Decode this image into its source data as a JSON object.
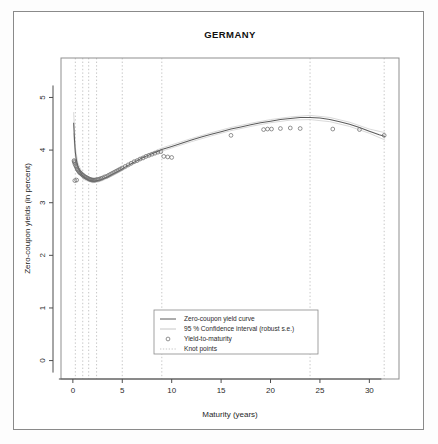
{
  "chart_data": {
    "type": "line",
    "title": "GERMANY",
    "xlabel": "Maturity (years)",
    "ylabel": "Zero-coupon yields (in percent)",
    "xlim": [
      -1.2,
      33.0
    ],
    "ylim": [
      -0.35,
      5.75
    ],
    "xticks": [
      0,
      5,
      10,
      15,
      20,
      25,
      30
    ],
    "yticks": [
      0,
      1,
      2,
      3,
      4,
      5
    ],
    "grid": false,
    "legend_position": "bottom-center",
    "series": [
      {
        "name": "Zero-coupon yield curve",
        "type": "line",
        "x": [
          0.08,
          0.17,
          0.25,
          0.35,
          0.5,
          0.7,
          0.9,
          1.1,
          1.3,
          1.5,
          1.75,
          2.0,
          2.25,
          2.5,
          2.75,
          3.0,
          3.5,
          4.0,
          4.5,
          5.0,
          5.5,
          6.0,
          6.5,
          7.0,
          7.5,
          8.0,
          8.5,
          9.0,
          9.5,
          10.0,
          11.0,
          12.0,
          13.0,
          14.0,
          15.0,
          16.0,
          17.0,
          18.0,
          19.0,
          20.0,
          21.0,
          22.0,
          23.0,
          24.0,
          25.0,
          26.0,
          27.0,
          28.0,
          29.0,
          30.0,
          31.0,
          31.6
        ],
        "y": [
          4.52,
          4.18,
          3.96,
          3.82,
          3.7,
          3.6,
          3.53,
          3.49,
          3.46,
          3.44,
          3.42,
          3.41,
          3.41,
          3.42,
          3.43,
          3.45,
          3.49,
          3.54,
          3.59,
          3.64,
          3.7,
          3.75,
          3.8,
          3.85,
          3.89,
          3.93,
          3.97,
          4.01,
          4.04,
          4.07,
          4.13,
          4.19,
          4.25,
          4.3,
          4.35,
          4.4,
          4.44,
          4.48,
          4.52,
          4.55,
          4.58,
          4.6,
          4.62,
          4.62,
          4.61,
          4.58,
          4.54,
          4.49,
          4.43,
          4.36,
          4.29,
          4.26
        ]
      },
      {
        "name": "95 % Confidence interval (robust s.e.)",
        "type": "band-upper",
        "x": [
          0.08,
          0.25,
          0.5,
          1.0,
          1.5,
          2.0,
          2.5,
          3.0,
          4.0,
          5.0,
          6.0,
          7.0,
          8.0,
          9.0,
          10.0,
          12.0,
          14.0,
          16.0,
          18.0,
          20.0,
          22.0,
          24.0,
          26.0,
          28.0,
          30.0,
          31.6
        ],
        "y": [
          4.72,
          4.05,
          3.76,
          3.54,
          3.47,
          3.44,
          3.45,
          3.48,
          3.57,
          3.67,
          3.78,
          3.88,
          3.96,
          4.04,
          4.1,
          4.22,
          4.33,
          4.43,
          4.51,
          4.58,
          4.63,
          4.66,
          4.62,
          4.53,
          4.4,
          4.33
        ]
      },
      {
        "name": "95 % Confidence interval (robust s.e.) lower",
        "type": "band-lower",
        "x": [
          0.08,
          0.25,
          0.5,
          1.0,
          1.5,
          2.0,
          2.5,
          3.0,
          4.0,
          5.0,
          6.0,
          7.0,
          8.0,
          9.0,
          10.0,
          12.0,
          14.0,
          16.0,
          18.0,
          20.0,
          22.0,
          24.0,
          26.0,
          28.0,
          30.0,
          31.6
        ],
        "y": [
          4.32,
          3.88,
          3.64,
          3.45,
          3.41,
          3.38,
          3.39,
          3.42,
          3.51,
          3.61,
          3.72,
          3.82,
          3.9,
          3.98,
          4.04,
          4.16,
          4.27,
          4.37,
          4.45,
          4.52,
          4.57,
          4.58,
          4.54,
          4.45,
          4.32,
          4.19
        ]
      }
    ],
    "scatter": {
      "name": "Yield-to-maturity",
      "marker": "open-circle",
      "points": [
        [
          0.12,
          3.8
        ],
        [
          0.14,
          3.78
        ],
        [
          0.18,
          3.76
        ],
        [
          0.22,
          3.73
        ],
        [
          0.2,
          3.42
        ],
        [
          0.38,
          3.43
        ],
        [
          0.3,
          3.7
        ],
        [
          0.36,
          3.68
        ],
        [
          0.42,
          3.65
        ],
        [
          0.48,
          3.63
        ],
        [
          0.55,
          3.61
        ],
        [
          0.62,
          3.59
        ],
        [
          0.7,
          3.57
        ],
        [
          0.78,
          3.56
        ],
        [
          0.86,
          3.55
        ],
        [
          0.95,
          3.53
        ],
        [
          1.05,
          3.52
        ],
        [
          1.15,
          3.5
        ],
        [
          1.25,
          3.49
        ],
        [
          1.35,
          3.48
        ],
        [
          1.45,
          3.47
        ],
        [
          1.55,
          3.46
        ],
        [
          1.65,
          3.45
        ],
        [
          1.75,
          3.44
        ],
        [
          1.85,
          3.44
        ],
        [
          1.95,
          3.43
        ],
        [
          2.05,
          3.43
        ],
        [
          2.15,
          3.43
        ],
        [
          2.25,
          3.43
        ],
        [
          2.4,
          3.44
        ],
        [
          2.55,
          3.44
        ],
        [
          2.7,
          3.45
        ],
        [
          2.85,
          3.46
        ],
        [
          3.0,
          3.47
        ],
        [
          3.2,
          3.49
        ],
        [
          3.4,
          3.5
        ],
        [
          3.6,
          3.52
        ],
        [
          3.8,
          3.54
        ],
        [
          4.0,
          3.56
        ],
        [
          4.2,
          3.58
        ],
        [
          4.4,
          3.6
        ],
        [
          4.6,
          3.62
        ],
        [
          4.8,
          3.64
        ],
        [
          5.0,
          3.66
        ],
        [
          5.3,
          3.69
        ],
        [
          5.6,
          3.72
        ],
        [
          5.9,
          3.75
        ],
        [
          6.2,
          3.78
        ],
        [
          6.5,
          3.8
        ],
        [
          6.8,
          3.83
        ],
        [
          7.1,
          3.85
        ],
        [
          7.4,
          3.88
        ],
        [
          7.7,
          3.9
        ],
        [
          8.0,
          3.92
        ],
        [
          8.3,
          3.94
        ],
        [
          8.6,
          3.96
        ],
        [
          8.9,
          3.97
        ],
        [
          9.2,
          3.88
        ],
        [
          9.6,
          3.87
        ],
        [
          10.0,
          3.86
        ],
        [
          16.0,
          4.28
        ],
        [
          19.3,
          4.39
        ],
        [
          19.7,
          4.4
        ],
        [
          20.1,
          4.4
        ],
        [
          21.0,
          4.41
        ],
        [
          22.0,
          4.42
        ],
        [
          23.0,
          4.41
        ],
        [
          26.3,
          4.4
        ],
        [
          29.0,
          4.39
        ],
        [
          31.5,
          4.28
        ]
      ]
    },
    "knot_points": {
      "name": "Knot points",
      "x": [
        0.25,
        1.0,
        1.6,
        2.4,
        5.0,
        9.0,
        24.0,
        31.5
      ]
    },
    "legend": [
      {
        "label": "Zero-coupon yield curve",
        "marker": "line"
      },
      {
        "label": "95 % Confidence interval (robust s.e.)",
        "marker": "line-ci"
      },
      {
        "label": "Yield-to-maturity",
        "marker": "circle"
      },
      {
        "label": "Knot points",
        "marker": "dashed-line"
      }
    ]
  }
}
